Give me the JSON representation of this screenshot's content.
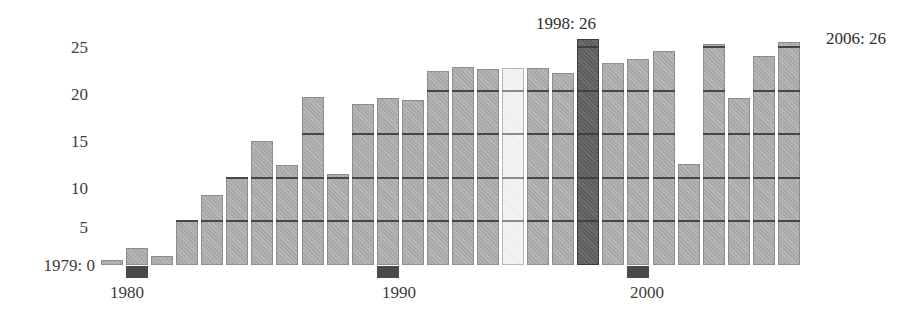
{
  "chart_data": {
    "type": "bar",
    "title": "",
    "xlabel": "",
    "ylabel": "",
    "ylim": [
      0,
      27
    ],
    "grid": true,
    "legend_position": "none",
    "y_ticks": [
      0,
      5,
      10,
      15,
      20,
      25
    ],
    "y_tick_labels": [
      "1979: 0",
      "5",
      "10",
      "15",
      "20",
      "25"
    ],
    "x_tick_labels": [
      "1980",
      "1990",
      "2000"
    ],
    "x_tick_categories": [
      "1980",
      "1990",
      "2000"
    ],
    "categories": [
      "1979",
      "1980",
      "1981",
      "1982",
      "1983",
      "1984",
      "1985",
      "1986",
      "1987",
      "1988",
      "1989",
      "1990",
      "1991",
      "1992",
      "1993",
      "1994",
      "1995",
      "1996",
      "1997",
      "1998",
      "1999",
      "2000",
      "2001",
      "2002",
      "2003",
      "2004",
      "2005",
      "2006"
    ],
    "values": [
      0.5,
      2,
      1,
      5,
      8,
      10,
      14.3,
      11.5,
      19.3,
      10.5,
      18.5,
      19.2,
      19,
      22.3,
      22.8,
      22.5,
      22.6,
      22.6,
      22.1,
      26,
      23.2,
      23.7,
      24.6,
      11.6,
      25.4,
      19.2,
      24,
      25.6
    ],
    "annotations": [
      {
        "text": "1998: 26",
        "category": "1998"
      },
      {
        "text": "2006: 26",
        "category": "2006"
      },
      {
        "text": "1979: 0",
        "category": "1979"
      }
    ],
    "highlight_light": [
      "1995"
    ],
    "highlight_dark": [
      "1998"
    ],
    "colors": {
      "bar": "#a8a8a8",
      "bar_highlight_dark": "#5d5d5d",
      "bar_highlight_light": "#f4f4f2",
      "gridline": "#3d3d3d",
      "tick_block": "#4a4a4a",
      "text": "#3c3c3c",
      "background": "#ffffff"
    }
  },
  "annotations": {
    "top_center": "1998: 26",
    "top_right": "2006: 26",
    "origin_label": "1979: 0"
  }
}
